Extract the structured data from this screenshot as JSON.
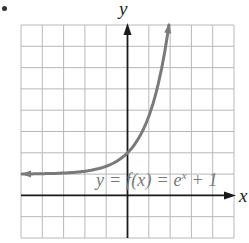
{
  "chart_data": {
    "type": "line",
    "title": "",
    "xlabel": "x",
    "ylabel": "y",
    "xlim": [
      -5,
      5
    ],
    "ylim": [
      -2,
      8
    ],
    "grid": true,
    "grid_step": 1,
    "series": [
      {
        "name": "y = f(x) = e^x + 1",
        "function": "e^x + 1",
        "x": [
          -5,
          -4,
          -3,
          -2,
          -1,
          0,
          0.5,
          1,
          1.5,
          1.95
        ],
        "values": [
          1.007,
          1.018,
          1.05,
          1.135,
          1.368,
          2,
          2.649,
          3.718,
          5.482,
          8.0
        ]
      }
    ],
    "annotations": [
      {
        "text": "y = f(x) = e^x + 1",
        "position": "lower right, above x-axis"
      }
    ],
    "legend": null
  },
  "labels": {
    "x_axis": "x",
    "y_axis": "y",
    "function_label": {
      "pre": "y = f(x) = e",
      "exp": "x",
      "post": " + 1"
    }
  },
  "colors": {
    "grid": "#b8b8b8",
    "axis": "#1a1a1a",
    "curve": "#7a7a7a",
    "label": "#777777"
  }
}
